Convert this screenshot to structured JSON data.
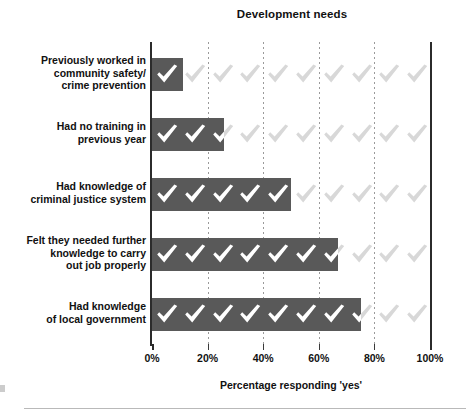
{
  "chart_data": {
    "type": "bar",
    "orientation": "horizontal",
    "title": "Development needs",
    "xlabel": "Percentage responding 'yes'",
    "ylabel": "",
    "categories": [
      "Previously worked in community safety/ crime prevention",
      "Had no training in previous year",
      "Had knowledge of criminal justice system",
      "Felt they needed further knowledge to carry out job properly",
      "Had knowledge of local government"
    ],
    "values": [
      11,
      26,
      50,
      67,
      75
    ],
    "xlim": [
      0,
      100
    ],
    "xticks": [
      0,
      20,
      40,
      60,
      80,
      100
    ],
    "xtick_labels": [
      "0%",
      "20%",
      "40%",
      "60%",
      "80%",
      "100%"
    ],
    "grid": "vertical dotted gridlines at 20% intervals",
    "legend": "none",
    "bar_motif": "white check-mark glyphs inside filled bars; pale grey check-marks continue across the unfilled remainder of each row"
  },
  "chart": {
    "title": "Development needs",
    "xaxis_title": "Percentage responding 'yes'",
    "xticks": [
      {
        "value": 0,
        "label": "0%"
      },
      {
        "value": 20,
        "label": "20%"
      },
      {
        "value": 40,
        "label": "40%"
      },
      {
        "value": 60,
        "label": "60%"
      },
      {
        "value": 80,
        "label": "80%"
      },
      {
        "value": 100,
        "label": "100%"
      }
    ],
    "bars": [
      {
        "label_lines": [
          "Previously worked in",
          "community safety/",
          "crime prevention"
        ],
        "value": 11
      },
      {
        "label_lines": [
          "Had no training in",
          "previous year"
        ],
        "value": 26
      },
      {
        "label_lines": [
          "Had knowledge of",
          "criminal justice system"
        ],
        "value": 50
      },
      {
        "label_lines": [
          "Felt they needed further",
          "knowledge to carry",
          "out job properly"
        ],
        "value": 67
      },
      {
        "label_lines": [
          "Had knowledge",
          "of local government"
        ],
        "value": 75
      }
    ]
  },
  "colors": {
    "bar_fill": "#595959",
    "check_on_bar": "#ffffff",
    "check_off_bar": "#d8d8d8",
    "axis": "#2b2b2b",
    "gridline": "#9a9a9a",
    "text": "#111111"
  },
  "icons": {
    "check": "check-mark-icon"
  }
}
